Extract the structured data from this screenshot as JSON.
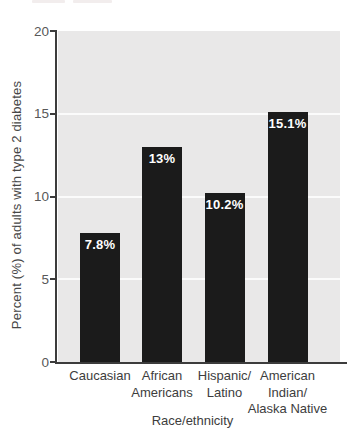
{
  "artifacts": {
    "description": "two faint cut-off strips at top edge of scan",
    "color": "#f2eded"
  },
  "chart_data": {
    "type": "bar",
    "title": "",
    "categories": [
      "Caucasian",
      "African\nAmericans",
      "Hispanic/\nLatino",
      "American\nIndian/\nAlaska Native"
    ],
    "values": [
      7.8,
      13,
      10.2,
      15.1
    ],
    "value_labels": [
      "7.8%",
      "13%",
      "10.2%",
      "15.1%"
    ],
    "xlabel": "Race/ethnicity",
    "ylabel": "Percent (%) of adults with type 2 diabetes",
    "ylim": [
      0,
      20
    ],
    "yticks": [
      0,
      5,
      10,
      15,
      20
    ],
    "grid": true,
    "legend": false,
    "colors": {
      "bar": "#1b1b1b",
      "plot_bg": "#e9e8e8",
      "gridline": "rgba(255,255,255,0.82)",
      "axis": "#3c3c3c",
      "tick_text": "#585858",
      "bar_label_text": "#ffffff",
      "category_text": "#3d3d3d"
    }
  }
}
